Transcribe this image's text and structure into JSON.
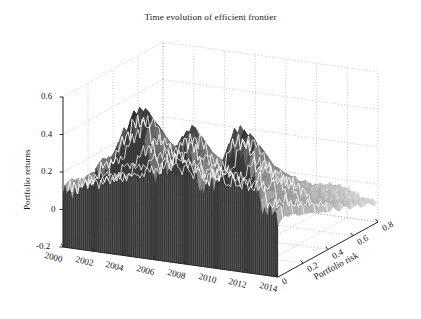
{
  "chart_data": {
    "type": "area",
    "render": "surface3d",
    "title": "Time evolution of efficient frontier",
    "xlabel": "",
    "ylabel": "Portfolio risk",
    "zlabel": "Portfolio returns",
    "x_axis": {
      "name": "time",
      "ticks": [
        "2000",
        "2002",
        "2004",
        "2006",
        "2008",
        "2010",
        "2012",
        "2014"
      ],
      "tick_values": [
        2000,
        2002,
        2004,
        2006,
        2008,
        2010,
        2012,
        2014
      ],
      "range": [
        2000,
        2014
      ]
    },
    "y_axis": {
      "name": "Portfolio risk",
      "ticks": [
        "0",
        "0.2",
        "0.4",
        "0.6",
        "0.8"
      ],
      "tick_values": [
        0,
        0.2,
        0.4,
        0.6,
        0.8
      ],
      "range": [
        0,
        0.8
      ]
    },
    "z_axis": {
      "name": "Portfolio returns",
      "ticks": [
        "0.6",
        "0.4",
        "0.2",
        "0",
        "-0.2"
      ],
      "tick_values": [
        0.6,
        0.4,
        0.2,
        0,
        -0.2
      ],
      "range": [
        -0.2,
        0.6
      ]
    },
    "grid": true,
    "legend": null,
    "colormap": "gray",
    "surface_colors": {
      "dark": "#2e2e2e",
      "mid": "#6f6f6f",
      "light": "#d8d8d8",
      "ridge": "#fdfdfd"
    },
    "axis_color": "#2a2a2a",
    "grid_color": "#9a9a9a",
    "background": "#ffffff",
    "peaks": [
      {
        "time": 2004.6,
        "risk": 0.06,
        "returns": 0.57
      },
      {
        "time": 2008.0,
        "risk": 0.08,
        "returns": 0.52
      },
      {
        "time": 2011.6,
        "risk": 0.1,
        "returns": 0.55
      }
    ],
    "series": [
      {
        "name": "returns_at_risk_0.05",
        "x": [
          2000,
          2001,
          2002,
          2003,
          2004,
          2005,
          2006,
          2007,
          2008,
          2009,
          2010,
          2011,
          2012,
          2013,
          2014
        ],
        "values": [
          0.1,
          0.14,
          0.21,
          0.33,
          0.5,
          0.57,
          0.3,
          0.4,
          0.52,
          0.25,
          0.34,
          0.55,
          0.48,
          0.2,
          0.14
        ]
      },
      {
        "name": "returns_at_risk_0.25",
        "x": [
          2000,
          2001,
          2002,
          2003,
          2004,
          2005,
          2006,
          2007,
          2008,
          2009,
          2010,
          2011,
          2012,
          2013,
          2014
        ],
        "values": [
          0.05,
          0.08,
          0.13,
          0.2,
          0.28,
          0.31,
          0.18,
          0.22,
          0.27,
          0.14,
          0.19,
          0.28,
          0.24,
          0.11,
          0.07
        ]
      },
      {
        "name": "returns_at_risk_0.45",
        "x": [
          2000,
          2001,
          2002,
          2003,
          2004,
          2005,
          2006,
          2007,
          2008,
          2009,
          2010,
          2011,
          2012,
          2013,
          2014
        ],
        "values": [
          0.01,
          0.03,
          0.05,
          0.09,
          0.13,
          0.14,
          0.07,
          0.09,
          0.12,
          0.05,
          0.07,
          0.12,
          0.1,
          0.03,
          0.01
        ]
      },
      {
        "name": "returns_at_risk_0.65",
        "x": [
          2000,
          2001,
          2002,
          2003,
          2004,
          2005,
          2006,
          2007,
          2008,
          2009,
          2010,
          2011,
          2012,
          2013,
          2014
        ],
        "values": [
          -0.04,
          -0.03,
          -0.02,
          0.0,
          0.02,
          0.02,
          -0.02,
          -0.01,
          0.01,
          -0.04,
          -0.03,
          0.01,
          0.0,
          -0.04,
          -0.05
        ]
      }
    ]
  },
  "geometry": {
    "origin_back_left": [
      63,
      247
    ],
    "front_bottom": [
      278,
      277
    ],
    "right_corner": [
      378,
      222
    ],
    "z_top": [
      63,
      97
    ],
    "z_pixels_per_unit": 187.5
  }
}
